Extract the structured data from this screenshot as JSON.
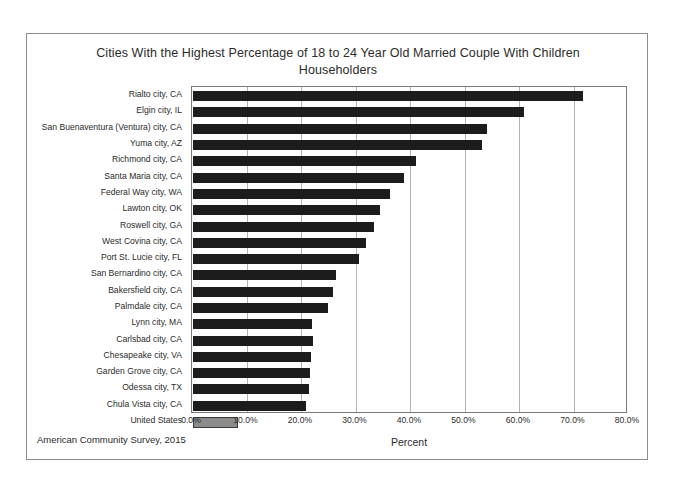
{
  "chart_data": {
    "type": "bar",
    "orientation": "horizontal",
    "title": "Cities With the Highest Percentage of 18 to 24 Year Old Married Couple With Children Householders",
    "xlabel": "Percent",
    "ylabel": "",
    "xlim": [
      0,
      80
    ],
    "xtick_labels": [
      "0.0%",
      "10.0%",
      "20.0%",
      "30.0%",
      "40.0%",
      "50.0%",
      "60.0%",
      "70.0%",
      "80.0%"
    ],
    "xtick_values": [
      0,
      10,
      20,
      30,
      40,
      50,
      60,
      70,
      80
    ],
    "grid": true,
    "legend": "none",
    "source_note": "American Community Survey, 2015",
    "categories": [
      "Rialto city, CA",
      "Elgin city, IL",
      "San Buenaventura (Ventura) city, CA",
      "Yuma city, AZ",
      "Richmond city, CA",
      "Santa Maria city, CA",
      "Federal Way city, WA",
      "Lawton city, OK",
      "Roswell city, GA",
      "West Covina city, CA",
      "Port St. Lucie city, FL",
      "San Bernardino city, CA",
      "Bakersfield city, CA",
      "Palmdale city, CA",
      "Lynn city, MA",
      "Carlsbad city, CA",
      "Chesapeake city, VA",
      "Garden Grove city, CA",
      "Odessa city, TX",
      "Chula Vista city, CA",
      "United States"
    ],
    "values": [
      71.5,
      60.8,
      54.0,
      53.0,
      41.0,
      38.8,
      36.2,
      34.4,
      33.2,
      31.8,
      30.4,
      26.2,
      25.6,
      24.8,
      21.8,
      22.0,
      21.6,
      21.4,
      21.2,
      20.8,
      8.2
    ],
    "bar_colors": [
      "#1c1c1c",
      "#1c1c1c",
      "#1c1c1c",
      "#1c1c1c",
      "#1c1c1c",
      "#1c1c1c",
      "#1c1c1c",
      "#1c1c1c",
      "#1c1c1c",
      "#1c1c1c",
      "#1c1c1c",
      "#1c1c1c",
      "#1c1c1c",
      "#1c1c1c",
      "#1c1c1c",
      "#1c1c1c",
      "#1c1c1c",
      "#1c1c1c",
      "#1c1c1c",
      "#1c1c1c",
      "#8c8c8c"
    ],
    "highlight_category": "United States",
    "colors": {
      "bar": "#1c1c1c",
      "highlight_bar": "#8c8c8c",
      "gridline": "#b4b4b4",
      "axis": "#7a7a7a",
      "frame": "#8d8d8d",
      "text": "#2b2b2b",
      "background": "#ffffff"
    }
  }
}
